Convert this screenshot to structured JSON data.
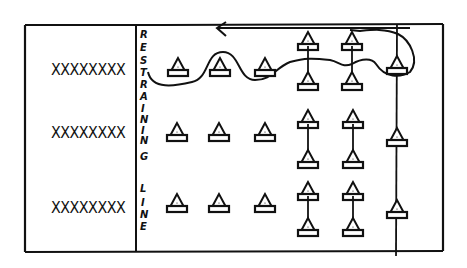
{
  "diagram": {
    "type": "hand-drawn drill diagram",
    "colors": {
      "ink": "#111111",
      "background": "#ffffff"
    },
    "player_rows": [
      {
        "label": "XXXXXXXX",
        "y": 72
      },
      {
        "label": "XXXXXXXX",
        "y": 134
      },
      {
        "label": "XXXXXXXX",
        "y": 210
      }
    ],
    "restraining_line": {
      "label": "RESTRAINING LINE",
      "letters": [
        "R",
        "E",
        "S",
        "T",
        "R",
        "A",
        "I",
        "N",
        "I",
        "N",
        "G",
        "",
        "L",
        "I",
        "N",
        "E"
      ]
    },
    "cones": {
      "single_columns_x": [
        178,
        220,
        265
      ],
      "paired_columns_x": [
        308,
        352
      ],
      "line_column_x": 398,
      "row_y": [
        70,
        134,
        204
      ]
    },
    "path": {
      "description": "weaving path through row 1 cones, around far cone, returning along top with arrow pointing left"
    }
  }
}
